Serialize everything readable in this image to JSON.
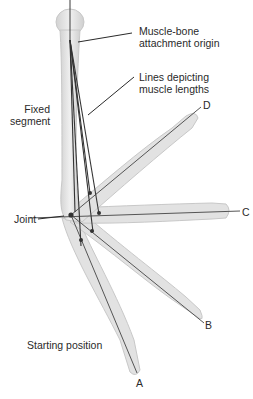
{
  "diagram": {
    "labels": {
      "origin_line1": "Muscle-bone",
      "origin_line2": "attachment origin",
      "lines_line1": "Lines depicting",
      "lines_line2": "muscle lengths",
      "fixed_line1": "Fixed",
      "fixed_line2": "segment",
      "joint": "Joint",
      "start": "Starting position",
      "pos_a": "A",
      "pos_b": "B",
      "pos_c": "C",
      "pos_d": "D"
    },
    "colors": {
      "bone_fill": "#e4e4e4",
      "bone_edge": "#c4c4c4",
      "line": "#3a3a3a",
      "text": "#2a2a2a"
    }
  }
}
